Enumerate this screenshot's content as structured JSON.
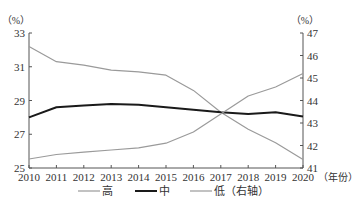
{
  "chart_data": {
    "type": "line",
    "title": "",
    "xlabel": "（年份）",
    "ylabel_left": "（%）",
    "ylabel_right": "（%）",
    "x": [
      2010,
      2011,
      2012,
      2013,
      2014,
      2015,
      2016,
      2017,
      2018,
      2019,
      2020
    ],
    "ylim_left": [
      25,
      33
    ],
    "yticks_left": [
      25,
      27,
      29,
      31,
      33
    ],
    "ylim_right": [
      41,
      47
    ],
    "yticks_right": [
      41,
      42,
      43,
      44,
      45,
      46,
      47
    ],
    "grid": false,
    "legend_position": "bottom",
    "series": [
      {
        "name": "高",
        "axis": "left",
        "color": "#9a9a9a",
        "width": 1.2,
        "values": [
          32.2,
          31.3,
          31.1,
          30.8,
          30.7,
          30.5,
          29.6,
          28.3,
          27.3,
          26.5,
          25.5
        ]
      },
      {
        "name": "中",
        "axis": "left",
        "color": "#1a1a1a",
        "width": 2,
        "values": [
          28.0,
          28.6,
          28.7,
          28.8,
          28.75,
          28.6,
          28.45,
          28.3,
          28.2,
          28.3,
          28.05
        ]
      },
      {
        "name": "低（右轴）",
        "axis": "right",
        "color": "#9a9a9a",
        "width": 1.2,
        "values": [
          41.4,
          41.6,
          41.7,
          41.8,
          41.9,
          42.1,
          42.6,
          43.4,
          44.2,
          44.6,
          45.2
        ]
      }
    ]
  }
}
